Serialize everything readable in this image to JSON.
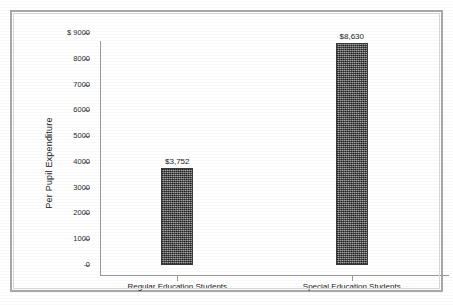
{
  "chart_data": {
    "type": "bar",
    "title": "",
    "subtitle": "",
    "xlabel": "",
    "ylabel": "Per Pupil Expenditure",
    "categories": [
      "Regular Education Students",
      "Special Education Students"
    ],
    "values": [
      3752,
      8630
    ],
    "value_labels": [
      "$3,752",
      "$8,630"
    ],
    "ylim": [
      0,
      9000
    ],
    "ytick_values": [
      9000,
      8000,
      7000,
      6000,
      5000,
      4000,
      3000,
      2000,
      1000,
      0
    ],
    "ytick_labels": [
      "$ 9000",
      "8000",
      "7000",
      "6000",
      "5000",
      "4000",
      "3000",
      "2000",
      "1000",
      "0"
    ],
    "currency_symbol": "$",
    "grid": false,
    "legend": false,
    "legend_position": "none",
    "bar_color": "#5f5f5f",
    "bar_edge_color": "#3a3a3a",
    "axis_color": "#9a9a9a",
    "text_color": "#1c1c1c",
    "background_color": "#ffffff",
    "frame_color": "#a8a8a8"
  }
}
